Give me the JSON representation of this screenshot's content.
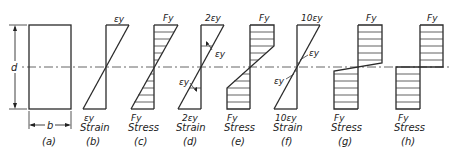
{
  "figure": {
    "dimension_labels": {
      "depth": "d",
      "width": "b"
    },
    "panels": [
      {
        "id": "a",
        "caption": "(a)",
        "kind": "cross-section"
      },
      {
        "id": "b",
        "caption": "(b)",
        "kind": "strain",
        "top_label": "εy",
        "bottom_label": "εy",
        "title": "Strain"
      },
      {
        "id": "c",
        "caption": "(c)",
        "kind": "stress",
        "top_label": "Fy",
        "bottom_label": "Fy",
        "title": "Stress"
      },
      {
        "id": "d",
        "caption": "(d)",
        "kind": "strain",
        "top_label": "2εy",
        "bottom_label": "2εy",
        "title": "Strain",
        "inner_label_top": "εy",
        "inner_label_bottom": "εy"
      },
      {
        "id": "e",
        "caption": "(e)",
        "kind": "stress",
        "top_label": "Fy",
        "bottom_label": "Fy",
        "title": "Stress"
      },
      {
        "id": "f",
        "caption": "(f)",
        "kind": "strain",
        "top_label": "10εy",
        "bottom_label": "10εy",
        "title": "Strain",
        "inner_label_top": "εy",
        "inner_label_bottom": "εy"
      },
      {
        "id": "g",
        "caption": "(g)",
        "kind": "stress",
        "top_label": "Fy",
        "bottom_label": "Fy",
        "title": "Stress"
      },
      {
        "id": "h",
        "caption": "(h)",
        "kind": "stress",
        "top_label": "Fy",
        "bottom_label": "Fy",
        "title": "Stress"
      }
    ]
  }
}
